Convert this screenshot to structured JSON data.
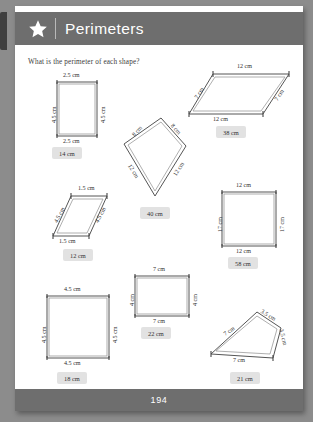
{
  "header": {
    "title": "Perimeters",
    "star_icon": "star-icon"
  },
  "footer": {
    "page_number": "194"
  },
  "instruction": "What is the perimeter of each shape?",
  "shapes": [
    {
      "id": "rectangle-1",
      "kind": "rectangle",
      "labels": {
        "top": "2.5 cm",
        "bottom": "2.5 cm",
        "left": "4.5 cm",
        "right": "4.5 cm"
      },
      "answer": "14 cm"
    },
    {
      "id": "parallelogram-1",
      "kind": "parallelogram",
      "labels": {
        "top": "12 cm",
        "bottom": "12 cm",
        "left": "7 cm",
        "right": "7 cm"
      },
      "answer": "38 cm"
    },
    {
      "id": "kite-1",
      "kind": "kite",
      "labels": {
        "upper_left": "8 cm",
        "upper_right": "8 cm",
        "lower_left": "12 cm",
        "lower_right": "12 cm"
      },
      "answer": "40 cm"
    },
    {
      "id": "parallelogram-2",
      "kind": "parallelogram",
      "labels": {
        "top": "1.5 cm",
        "bottom": "1.5 cm",
        "left": "4.5 cm",
        "right": "4.5 cm"
      },
      "answer": "12 cm"
    },
    {
      "id": "rectangle-2",
      "kind": "rectangle",
      "labels": {
        "top": "12 cm",
        "bottom": "12 cm",
        "left": "17 cm",
        "right": "17 cm"
      },
      "answer": "58 cm"
    },
    {
      "id": "square-1",
      "kind": "square",
      "labels": {
        "top": "4.5 cm",
        "bottom": "4.5 cm",
        "left": "4.5 cm",
        "right": "4.5 cm"
      },
      "answer": "18 cm"
    },
    {
      "id": "rectangle-3",
      "kind": "rectangle",
      "labels": {
        "top": "7 cm",
        "bottom": "7 cm",
        "left": "4 cm",
        "right": "4 cm"
      },
      "answer": "22 cm"
    },
    {
      "id": "quadrilateral-1",
      "kind": "quadrilateral",
      "labels": {
        "upper_left": "7 cm",
        "upper_right": "3.5 cm",
        "right": "3.5 cm",
        "bottom": "7 cm"
      },
      "answer": "21 cm"
    }
  ]
}
